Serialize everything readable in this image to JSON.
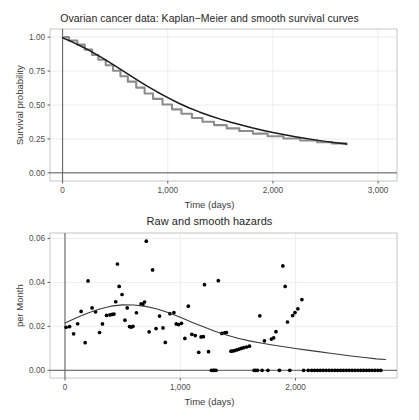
{
  "figure": {
    "background": "#ffffff",
    "panel_background": "#ffffff",
    "grid_color": "#ebebeb",
    "panel_border_color": "#bfbfbf",
    "axis_line_color": "#4d4d4d",
    "curve_color": "#1a1a1a",
    "km_curve_color": "#8c8c8c",
    "point_color": "#000000"
  },
  "charts": [
    {
      "id": "survival",
      "title": "Ovarian cancer data: Kaplan−Meier and smooth survival curves",
      "xlabel": "Time (days)",
      "ylabel": "Survival probability",
      "x_ticks": [
        "0",
        "1,000",
        "2,000",
        "3,000"
      ],
      "y_ticks": [
        "0.00",
        "0.25",
        "0.50",
        "0.75",
        "1.00"
      ]
    },
    {
      "id": "hazard",
      "title": "Raw and smooth hazards",
      "xlabel": "Time (days)",
      "ylabel": "per Month",
      "x_ticks": [
        "0",
        "1,000",
        "2,000"
      ],
      "y_ticks": [
        "0.00",
        "0.02",
        "0.04",
        "0.06"
      ]
    }
  ],
  "chart_data": [
    {
      "type": "line",
      "id": "survival-curve",
      "title": "Ovarian cancer data: Kaplan−Meier and smooth survival curves",
      "xlabel": "Time (days)",
      "ylabel": "Survival probability",
      "xlim": [
        -120,
        3180
      ],
      "ylim": [
        -0.06,
        1.06
      ],
      "xticks": [
        0,
        1000,
        2000,
        3000
      ],
      "xticklabels": [
        "0",
        "1,000",
        "2,000",
        "3,000"
      ],
      "yticks": [
        0.0,
        0.25,
        0.5,
        0.75,
        1.0
      ],
      "yticklabels": [
        "0.00",
        "0.25",
        "0.50",
        "0.75",
        "1.00"
      ],
      "grid": true,
      "legend": "none",
      "series": [
        {
          "name": "Kaplan-Meier estimate",
          "color": "#8c8c8c",
          "style": "step",
          "x": [
            0,
            60,
            140,
            210,
            280,
            340,
            410,
            480,
            550,
            620,
            700,
            780,
            860,
            950,
            1040,
            1130,
            1230,
            1330,
            1440,
            1560,
            1680,
            1810,
            1950,
            2100,
            2260,
            2420,
            2560,
            2700
          ],
          "y": [
            1.0,
            0.975,
            0.945,
            0.908,
            0.868,
            0.833,
            0.793,
            0.752,
            0.712,
            0.672,
            0.628,
            0.585,
            0.545,
            0.504,
            0.468,
            0.436,
            0.404,
            0.377,
            0.352,
            0.328,
            0.308,
            0.289,
            0.27,
            0.253,
            0.238,
            0.226,
            0.217,
            0.21
          ]
        },
        {
          "name": "Smooth survival curve",
          "color": "#1a1a1a",
          "style": "line",
          "x": [
            0,
            100,
            200,
            300,
            400,
            500,
            600,
            700,
            800,
            900,
            1000,
            1100,
            1200,
            1300,
            1400,
            1500,
            1600,
            1700,
            1800,
            1900,
            2000,
            2100,
            2200,
            2300,
            2400,
            2500,
            2600,
            2700
          ],
          "y": [
            0.995,
            0.962,
            0.924,
            0.882,
            0.836,
            0.788,
            0.738,
            0.689,
            0.641,
            0.596,
            0.554,
            0.515,
            0.48,
            0.449,
            0.421,
            0.396,
            0.373,
            0.352,
            0.332,
            0.314,
            0.297,
            0.282,
            0.268,
            0.255,
            0.243,
            0.232,
            0.222,
            0.212
          ]
        }
      ]
    },
    {
      "type": "scatter",
      "id": "hazard-plot",
      "title": "Raw and smooth hazards",
      "xlabel": "Time (days)",
      "ylabel": "per Month",
      "xlim": [
        -130,
        2880
      ],
      "ylim": [
        -0.0035,
        0.0625
      ],
      "xticks": [
        0,
        1000,
        2000
      ],
      "xticklabels": [
        "0",
        "1,000",
        "2,000"
      ],
      "yticks": [
        0.0,
        0.02,
        0.04,
        0.06
      ],
      "yticklabels": [
        "0.00",
        "0.02",
        "0.04",
        "0.06"
      ],
      "grid": true,
      "legend": "none",
      "series": [
        {
          "name": "Raw hazard",
          "color": "#000000",
          "style": "points",
          "points": [
            [
              10,
              0.0196
            ],
            [
              40,
              0.0199
            ],
            [
              75,
              0.0166
            ],
            [
              110,
              0.0212
            ],
            [
              140,
              0.0268
            ],
            [
              175,
              0.0126
            ],
            [
              200,
              0.0407
            ],
            [
              235,
              0.0284
            ],
            [
              265,
              0.0266
            ],
            [
              300,
              0.0172
            ],
            [
              325,
              0.0211
            ],
            [
              360,
              0.025
            ],
            [
              390,
              0.0252
            ],
            [
              410,
              0.0255
            ],
            [
              425,
              0.0256
            ],
            [
              440,
              0.0312
            ],
            [
              455,
              0.0484
            ],
            [
              470,
              0.0382
            ],
            [
              495,
              0.0345
            ],
            [
              520,
              0.0228
            ],
            [
              540,
              0.0284
            ],
            [
              560,
              0.0199
            ],
            [
              575,
              0.0197
            ],
            [
              590,
              0.02
            ],
            [
              620,
              0.0262
            ],
            [
              660,
              0.0302
            ],
            [
              675,
              0.03
            ],
            [
              690,
              0.0311
            ],
            [
              705,
              0.0588
            ],
            [
              730,
              0.0175
            ],
            [
              760,
              0.0457
            ],
            [
              790,
              0.019
            ],
            [
              820,
              0.0247
            ],
            [
              850,
              0.0193
            ],
            [
              870,
              0.0127
            ],
            [
              910,
              0.0258
            ],
            [
              945,
              0.0263
            ],
            [
              965,
              0.0211
            ],
            [
              985,
              0.0208
            ],
            [
              1010,
              0.0214
            ],
            [
              1040,
              0.0145
            ],
            [
              1070,
              0.0292
            ],
            [
              1100,
              0.0164
            ],
            [
              1130,
              0.0158
            ],
            [
              1160,
              0.0082
            ],
            [
              1180,
              0.0152
            ],
            [
              1200,
              0.0153
            ],
            [
              1210,
              0.039
            ],
            [
              1245,
              0.0085
            ],
            [
              1270,
              0.0
            ],
            [
              1285,
              0.0
            ],
            [
              1295,
              0.0
            ],
            [
              1310,
              0.0
            ],
            [
              1330,
              0.0408
            ],
            [
              1360,
              0.0168
            ],
            [
              1385,
              0.0171
            ],
            [
              1400,
              0.0172
            ],
            [
              1440,
              0.0087
            ],
            [
              1455,
              0.0088
            ],
            [
              1470,
              0.009
            ],
            [
              1490,
              0.0093
            ],
            [
              1510,
              0.0096
            ],
            [
              1530,
              0.01
            ],
            [
              1550,
              0.0103
            ],
            [
              1575,
              0.0106
            ],
            [
              1600,
              0.011
            ],
            [
              1640,
              0.0
            ],
            [
              1655,
              0.0
            ],
            [
              1670,
              0.0
            ],
            [
              1690,
              0.0248
            ],
            [
              1710,
              0.0
            ],
            [
              1730,
              0.0134
            ],
            [
              1760,
              0.0
            ],
            [
              1790,
              0.0142
            ],
            [
              1810,
              0.0148
            ],
            [
              1830,
              0.0176
            ],
            [
              1860,
              0.0
            ],
            [
              1890,
              0.0475
            ],
            [
              1910,
              0.0382
            ],
            [
              1930,
              0.022
            ],
            [
              1950,
              0.0
            ],
            [
              1975,
              0.0249
            ],
            [
              1995,
              0.0263
            ],
            [
              2020,
              0.028
            ],
            [
              2055,
              0.0322
            ],
            [
              2070,
              0.0
            ],
            [
              2110,
              0.0
            ],
            [
              2140,
              0.0
            ],
            [
              2165,
              0.0
            ],
            [
              2190,
              0.0
            ],
            [
              2215,
              0.0
            ],
            [
              2240,
              0.0
            ],
            [
              2265,
              0.0
            ],
            [
              2290,
              0.0
            ],
            [
              2315,
              0.0
            ],
            [
              2340,
              0.0
            ],
            [
              2365,
              0.0
            ],
            [
              2390,
              0.0
            ],
            [
              2415,
              0.0
            ],
            [
              2440,
              0.0
            ],
            [
              2465,
              0.0
            ],
            [
              2490,
              0.0
            ],
            [
              2515,
              0.0
            ],
            [
              2540,
              0.0
            ],
            [
              2565,
              0.0
            ],
            [
              2590,
              0.0
            ],
            [
              2615,
              0.0
            ],
            [
              2640,
              0.0
            ],
            [
              2665,
              0.0
            ],
            [
              2690,
              0.0
            ],
            [
              2715,
              0.0
            ],
            [
              2740,
              0.0
            ]
          ]
        },
        {
          "name": "Smooth hazard",
          "color": "#3a3a3a",
          "style": "line",
          "x": [
            0,
            100,
            200,
            300,
            400,
            500,
            600,
            700,
            800,
            900,
            1000,
            1100,
            1200,
            1300,
            1400,
            1500,
            1600,
            1700,
            1800,
            1900,
            2000,
            2100,
            2200,
            2300,
            2400,
            2500,
            2600,
            2700,
            2780
          ],
          "y": [
            0.0215,
            0.0239,
            0.0261,
            0.0279,
            0.0292,
            0.0298,
            0.0297,
            0.0291,
            0.0279,
            0.0262,
            0.0241,
            0.0219,
            0.0198,
            0.0178,
            0.0161,
            0.0146,
            0.0134,
            0.0124,
            0.0115,
            0.0107,
            0.0099,
            0.0092,
            0.0085,
            0.0078,
            0.0071,
            0.0064,
            0.0058,
            0.0052,
            0.0049
          ]
        }
      ]
    }
  ]
}
